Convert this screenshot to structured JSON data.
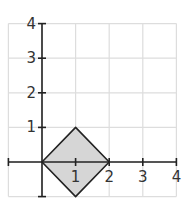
{
  "chart_data": {
    "type": "area",
    "title": "",
    "xlabel": "",
    "ylabel": "",
    "xlim": [
      -1,
      4
    ],
    "ylim": [
      -1,
      4
    ],
    "grid": true,
    "x_ticks": [
      "1",
      "2",
      "3",
      "4"
    ],
    "y_ticks": [
      "1",
      "2",
      "3",
      "4"
    ],
    "series": [
      {
        "name": "shaded square (diamond)",
        "vertices": [
          [
            0,
            0
          ],
          [
            1,
            1
          ],
          [
            2,
            0
          ],
          [
            1,
            -1
          ]
        ],
        "fill": "#d6d6d6",
        "stroke": "#222222"
      }
    ]
  },
  "colors": {
    "grid": "#dddddd",
    "axis": "#222222",
    "fill": "#d6d6d6",
    "text": "#333333"
  }
}
